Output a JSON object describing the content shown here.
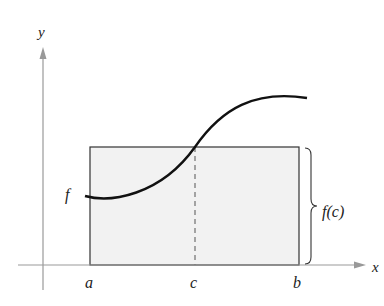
{
  "diagram": {
    "axes": {
      "x_label": "x",
      "y_label": "y"
    },
    "curve_label": "f",
    "points": {
      "a": "a",
      "b": "b",
      "c": "c"
    },
    "brace_label": "f(c)",
    "colors": {
      "axis": "#999999",
      "curve": "#111111",
      "rect_fill": "#f2f2f2",
      "rect_stroke": "#333333"
    }
  }
}
